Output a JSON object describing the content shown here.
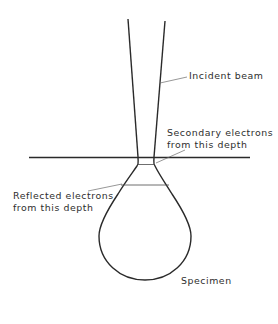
{
  "diagram": {
    "labels": {
      "incident_beam": "Incident beam",
      "secondary_line1": "Secondary electrons",
      "secondary_line2": "from this depth",
      "reflected_line1": "Reflected electrons",
      "reflected_line2": "from this depth",
      "specimen": "Specimen"
    },
    "colors": {
      "line": "#2a2a2a",
      "text": "#2e2e2e",
      "background": "#ffffff"
    }
  }
}
